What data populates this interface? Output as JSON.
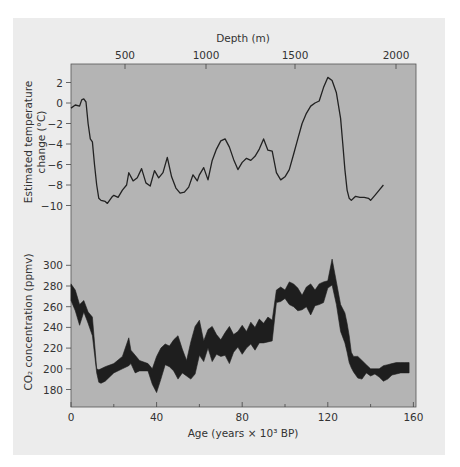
{
  "figure": {
    "top_axis_title": "Depth (m)",
    "bottom_axis_title": "Age (years × 10³ BP)",
    "temp_axis_title_line1": "Estimated temperature",
    "temp_axis_title_line2": "change (°C)",
    "co2_axis_title": "CO₂ concentration (ppmv)",
    "colors": {
      "page": "#ffffff",
      "panel": "#ececec",
      "plot": "#b4b4b4",
      "ink": "#222222"
    }
  },
  "chart_data": [
    {
      "type": "line",
      "title": "",
      "xlabel": "Age (years × 10³ BP)",
      "ylabel": "Estimated temperature change (°C)",
      "x_secondary_label": "Depth (m)",
      "x_secondary_ticks": [
        500,
        1000,
        1500,
        2000
      ],
      "xlim": [
        0,
        160
      ],
      "ylim": [
        -11,
        3.5
      ],
      "yticks": [
        2,
        0,
        -2,
        -4,
        -6,
        -8,
        -10
      ],
      "grid": false,
      "series": [
        {
          "name": "Temperature change",
          "x": [
            0,
            2,
            4,
            5,
            6,
            7,
            8,
            9,
            10,
            11,
            12,
            13,
            14,
            16,
            17,
            19,
            20,
            22,
            24,
            26,
            27,
            29,
            31,
            33,
            35,
            37,
            39,
            41,
            43,
            45,
            47,
            49,
            51,
            53,
            55,
            57,
            59,
            60,
            62,
            64,
            66,
            68,
            70,
            72,
            74,
            76,
            78,
            80,
            82,
            84,
            86,
            88,
            90,
            92,
            94,
            96,
            98,
            100,
            102,
            104,
            106,
            108,
            110,
            112,
            114,
            116,
            118,
            120,
            122,
            124,
            126,
            127,
            128,
            129,
            130,
            131,
            132,
            133,
            135,
            137,
            139,
            140,
            142,
            144,
            146,
            148,
            150,
            152,
            154,
            156,
            158,
            160
          ],
          "values": [
            -0.5,
            -0.2,
            -0.3,
            0.3,
            0.4,
            0.1,
            -2.0,
            -3.5,
            -3.8,
            -6.0,
            -8.0,
            -9.3,
            -9.5,
            -9.6,
            -9.8,
            -9.2,
            -9.0,
            -9.2,
            -8.5,
            -8.0,
            -6.8,
            -7.6,
            -7.3,
            -6.4,
            -7.8,
            -8.1,
            -6.6,
            -7.3,
            -6.8,
            -5.3,
            -7.2,
            -8.3,
            -8.8,
            -8.7,
            -8.2,
            -7.0,
            -7.6,
            -7.0,
            -6.3,
            -7.5,
            -5.6,
            -4.5,
            -3.7,
            -3.5,
            -4.3,
            -5.5,
            -6.5,
            -5.8,
            -5.4,
            -5.6,
            -5.2,
            -4.5,
            -3.5,
            -4.6,
            -4.7,
            -6.8,
            -7.5,
            -7.2,
            -6.5,
            -5.0,
            -3.5,
            -2.0,
            -1.0,
            -0.3,
            0.0,
            0.2,
            1.5,
            2.5,
            2.2,
            1.0,
            -1.5,
            -4.0,
            -6.5,
            -8.5,
            -9.3,
            -9.5,
            -9.3,
            -9.1,
            -9.2,
            -9.2,
            -9.3,
            -9.5,
            -9.0,
            -8.5,
            -8.0
          ]
        }
      ]
    },
    {
      "type": "area",
      "title": "",
      "xlabel": "Age (years × 10³ BP)",
      "ylabel": "CO₂ concentration (ppmv)",
      "xlim": [
        0,
        160
      ],
      "ylim": [
        163,
        310
      ],
      "xticks": [
        0,
        40,
        80,
        120,
        160
      ],
      "yticks": [
        300,
        280,
        260,
        240,
        220,
        200,
        180
      ],
      "grid": false,
      "series": [
        {
          "name": "CO₂ upper bound",
          "x": [
            0,
            2,
            4,
            6,
            8,
            10,
            12,
            13,
            14,
            16,
            20,
            24,
            27,
            28,
            30,
            32,
            36,
            38,
            40,
            42,
            44,
            46,
            48,
            50,
            52,
            54,
            56,
            58,
            60,
            62,
            64,
            66,
            68,
            70,
            72,
            74,
            76,
            78,
            80,
            82,
            84,
            86,
            88,
            90,
            92,
            94,
            96,
            98,
            100,
            102,
            104,
            106,
            108,
            110,
            112,
            114,
            116,
            118,
            120,
            122,
            124,
            126,
            128,
            129,
            130,
            131,
            132,
            134,
            136,
            138,
            140,
            142,
            144,
            146,
            148,
            150,
            152,
            154,
            156,
            158
          ],
          "values": [
            282,
            276,
            262,
            266,
            255,
            250,
            200,
            199,
            200,
            202,
            205,
            212,
            230,
            218,
            213,
            208,
            205,
            200,
            212,
            220,
            224,
            222,
            228,
            232,
            219,
            208,
            226,
            241,
            247,
            227,
            238,
            241,
            233,
            228,
            235,
            241,
            233,
            236,
            242,
            236,
            245,
            240,
            248,
            244,
            250,
            247,
            276,
            279,
            276,
            284,
            282,
            278,
            271,
            279,
            282,
            276,
            282,
            284,
            285,
            306,
            284,
            262,
            254,
            244,
            232,
            216,
            212,
            212,
            208,
            204,
            200,
            200,
            200,
            203,
            204,
            205,
            206,
            206,
            206,
            206
          ]
        },
        {
          "name": "CO₂ lower bound",
          "x": [
            0,
            2,
            4,
            6,
            8,
            10,
            12,
            13,
            14,
            16,
            20,
            24,
            27,
            28,
            30,
            32,
            36,
            38,
            40,
            42,
            44,
            46,
            48,
            50,
            52,
            54,
            56,
            58,
            60,
            62,
            64,
            66,
            68,
            70,
            72,
            74,
            76,
            78,
            80,
            82,
            84,
            86,
            88,
            90,
            92,
            94,
            96,
            98,
            100,
            102,
            104,
            106,
            108,
            110,
            112,
            114,
            116,
            118,
            120,
            122,
            124,
            126,
            128,
            129,
            130,
            131,
            132,
            134,
            136,
            138,
            140,
            142,
            144,
            146,
            148,
            150,
            152,
            154,
            156,
            158
          ],
          "values": [
            266,
            256,
            242,
            255,
            244,
            232,
            196,
            187,
            186,
            188,
            196,
            200,
            203,
            205,
            196,
            198,
            198,
            185,
            177,
            190,
            204,
            202,
            198,
            190,
            196,
            193,
            190,
            195,
            213,
            207,
            220,
            207,
            214,
            212,
            213,
            205,
            216,
            221,
            214,
            220,
            224,
            218,
            225,
            225,
            226,
            227,
            264,
            265,
            268,
            262,
            260,
            256,
            257,
            260,
            252,
            261,
            262,
            264,
            278,
            281,
            262,
            236,
            225,
            216,
            206,
            201,
            197,
            191,
            190,
            196,
            193,
            195,
            192,
            188,
            190,
            194,
            195,
            196,
            196,
            196
          ]
        }
      ]
    }
  ]
}
